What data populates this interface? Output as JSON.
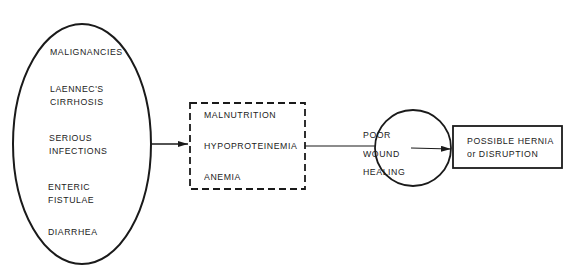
{
  "diagram": {
    "causes": {
      "items": [
        {
          "line1": "MALIGNANCIES",
          "line2": ""
        },
        {
          "line1": "LAENNEC'S",
          "line2": "CIRRHOSIS"
        },
        {
          "line1": "SERIOUS",
          "line2": "INFECTIONS"
        },
        {
          "line1": "ENTERIC",
          "line2": "FISTULAE"
        },
        {
          "line1": "DIARRHEA",
          "line2": ""
        }
      ]
    },
    "conditions": {
      "items": [
        "MALNUTRITION",
        "HYPOPROTEINEMIA",
        "ANEMIA"
      ]
    },
    "effect": {
      "lines": [
        "POOR",
        "WOUND",
        "HEALING"
      ]
    },
    "outcome": {
      "line1": "POSSIBLE HERNIA",
      "line2": "or DISRUPTION"
    }
  }
}
